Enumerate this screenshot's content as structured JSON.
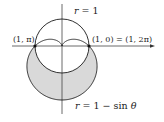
{
  "figure": {
    "scale_px_per_unit": 27,
    "origin_px": [
      62,
      46
    ],
    "colors": {
      "stroke": "#1a1a1a",
      "shade": "#d9d9d9",
      "axis": "#444444"
    },
    "curves": [
      {
        "name": "circle",
        "equation_label": "r = 1",
        "polar": "r = 1"
      },
      {
        "name": "cardioid",
        "equation_label": "r = 1 − sin θ",
        "polar": "r = 1 - sin(theta)"
      }
    ],
    "labels": {
      "circle_eq_r": "r",
      "circle_eq_rest": " = 1",
      "cardioid_eq_r": "r",
      "cardioid_eq_mid": " = 1 − sin ",
      "cardioid_eq_theta": "θ",
      "left_point": "(1, π)",
      "right_point": "(1, 0) = (1, 2π)"
    },
    "intersection_points": [
      {
        "label": "(1, π)",
        "xy": [
          -1,
          0
        ]
      },
      {
        "label": "(1, 0) = (1, 2π)",
        "xy": [
          1,
          0
        ]
      }
    ],
    "shaded_region": "inside cardioid, outside circle (lower half-plane)"
  }
}
